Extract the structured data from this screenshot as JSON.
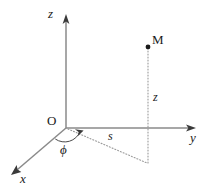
{
  "diagram": {
    "canvas": {
      "width": 204,
      "height": 191,
      "background": "#ffffff"
    },
    "colors": {
      "axis": "#8a8a8a",
      "arrow": "#3a3a3a",
      "dotted": "#9a9a9a",
      "arc": "#4a4a4a",
      "label": "#1a1a1a",
      "point": "#1a1a1a"
    },
    "origin": {
      "label": "O",
      "x": 66,
      "y": 128
    },
    "axes": [
      {
        "name": "x",
        "label": "x",
        "label_x": 23,
        "label_y": 179,
        "tip_x": 11,
        "tip_y": 175,
        "style": "italic"
      },
      {
        "name": "y",
        "label": "y",
        "label_x": 193,
        "label_y": 137,
        "tip_x": 196,
        "tip_y": 128,
        "style": "italic"
      },
      {
        "name": "z",
        "label": "z",
        "label_x": 51,
        "label_y": 14,
        "tip_x": 66,
        "tip_y": 15,
        "style": "italic"
      }
    ],
    "point": {
      "label": "M",
      "dot_x": 148,
      "dot_y": 47,
      "label_x": 156,
      "label_y": 40
    },
    "measures": [
      {
        "name": "height",
        "label": "z",
        "label_x": 156,
        "label_y": 97,
        "style": "italic"
      },
      {
        "name": "radial",
        "label": "s",
        "label_x": 111,
        "label_y": 136,
        "style": "italic"
      }
    ],
    "angle": {
      "label": "ϕ",
      "label_x": 63,
      "label_y": 150,
      "from_axis": "x",
      "to_line": "s"
    },
    "projection_corner": {
      "x": 148,
      "y": 163
    }
  }
}
